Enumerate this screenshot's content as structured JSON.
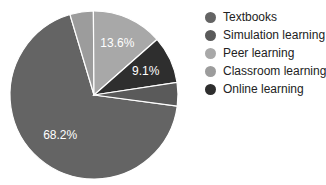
{
  "chart_data": {
    "type": "pie",
    "title": "",
    "categories": [
      "Textbooks",
      "Simulation learning",
      "Peer learning",
      "Classroom learning",
      "Online learning"
    ],
    "values": [
      68.2,
      4.5,
      13.6,
      4.5,
      9.1
    ],
    "value_labels": [
      "68.2%",
      "",
      "13.6%",
      "",
      "9.1%"
    ],
    "colors": [
      "#646464",
      "#5a5a5a",
      "#a8a8a8",
      "#9c9c9c",
      "#2e2e2e"
    ],
    "draw_order_clockwise": [
      "Textbooks",
      "Classroom learning",
      "Peer learning",
      "Online learning",
      "Simulation learning"
    ],
    "legend_position": "right"
  },
  "legend": {
    "items": [
      {
        "label": "Textbooks",
        "color": "#646464"
      },
      {
        "label": "Simulation learning",
        "color": "#5a5a5a"
      },
      {
        "label": "Peer learning",
        "color": "#a8a8a8"
      },
      {
        "label": "Classroom learning",
        "color": "#9c9c9c"
      },
      {
        "label": "Online learning",
        "color": "#2e2e2e"
      }
    ]
  }
}
